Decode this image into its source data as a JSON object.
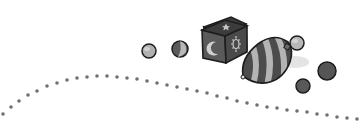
{
  "illustration": {
    "description": "Grayscale toy illustration: marbles, toy block with moon, star and sun, striped spinning top, dotted path",
    "colors": {
      "background": "#ffffff",
      "outline": "#1e1e1e",
      "dark": "#4a4a4a",
      "mid": "#6e6e6e",
      "light": "#b4b4b4",
      "dots": "#707070"
    },
    "elements": [
      {
        "name": "light-marble",
        "cx": 149,
        "cy": 51,
        "r": 7
      },
      {
        "name": "swirl-marble",
        "cx": 180,
        "cy": 49,
        "r": 8
      },
      {
        "name": "toy-block",
        "symbols": [
          "star",
          "moon",
          "sun"
        ]
      },
      {
        "name": "spinning-top",
        "stripes": 4
      },
      {
        "name": "small-light-ball",
        "cx": 297,
        "cy": 43,
        "r": 7
      },
      {
        "name": "dark-marble-right",
        "cx": 327,
        "cy": 71,
        "r": 9
      },
      {
        "name": "dark-marble-bottom",
        "cx": 303,
        "cy": 86,
        "r": 7
      }
    ]
  }
}
